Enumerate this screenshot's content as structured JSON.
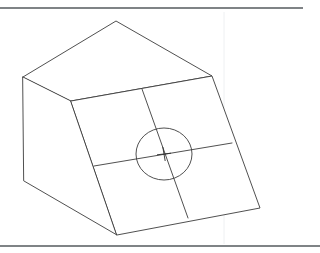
{
  "document": {
    "title": "Isometric Wedge Block Drawing",
    "description": "Line drawing of a wedge-shaped solid in isometric projection with a gridded sloped face and a centered circular hole",
    "background_color": "#ffffff",
    "line_color": "#3c3c3c",
    "frame_color": "#555a5e",
    "guide_color": "#eceef0",
    "width": 320,
    "height": 253
  },
  "frame": {
    "top_rule": {
      "name": "top-border-rule",
      "x1": 0,
      "y1": 8,
      "x2": 303,
      "y2": 8
    },
    "bottom_rule": {
      "name": "bottom-border-rule",
      "x1": 0,
      "y1": 246,
      "x2": 320,
      "y2": 246
    },
    "vertical_guide": {
      "name": "faint-vertical-guide",
      "x1": 224,
      "y1": 12,
      "x2": 224,
      "y2": 244
    }
  },
  "geometry": {
    "vertices": {
      "apex_top": {
        "name": "apex-top-vertex",
        "x": 116,
        "y": 21
      },
      "left_top": {
        "name": "left-top-vertex",
        "x": 23,
        "y": 77
      },
      "right_top": {
        "name": "right-top-vertex",
        "x": 212,
        "y": 76
      },
      "face_top_left": {
        "name": "face-top-left-vertex",
        "x": 71,
        "y": 101
      },
      "left_bottom": {
        "name": "left-bottom-vertex",
        "x": 24,
        "y": 181
      },
      "bottom": {
        "name": "bottom-vertex",
        "x": 117,
        "y": 235
      },
      "right_bottom": {
        "name": "right-bottom-vertex",
        "x": 260,
        "y": 208
      }
    },
    "faces": {
      "top_face": {
        "name": "top-roof-face",
        "points": "23,77 116,21 212,76 71,101"
      },
      "left_face": {
        "name": "left-side-face",
        "points": "23,77 71,101 117,235 24,181"
      },
      "sloped_face": {
        "name": "sloped-front-face",
        "points": "71,101 212,76 260,208 117,235"
      }
    }
  },
  "grid": {
    "vertical_division": {
      "name": "grid-line-vertical",
      "x1": 142,
      "y1": 89,
      "x2": 188,
      "y2": 218
    },
    "horizontal_division": {
      "name": "grid-line-horizontal",
      "x1": 94,
      "y1": 166,
      "x2": 232,
      "y2": 143
    }
  },
  "hole": {
    "name": "circular-hole",
    "center_x": 164,
    "center_y": 154,
    "radius_x": 28,
    "radius_y": 26,
    "center_mark": {
      "name": "center-cross-mark",
      "arm_length": 7
    }
  }
}
